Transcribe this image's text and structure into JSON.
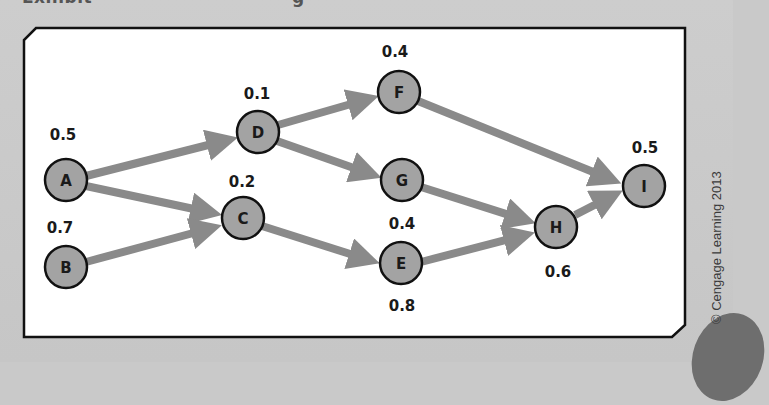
{
  "header": {
    "title_left": "Exhibit",
    "title_right": "g"
  },
  "diagram": {
    "colors": {
      "background": "#c9c9c9",
      "panel": "#ffffff",
      "frame": "#111111",
      "node_fill": "#a3a3a3",
      "node_stroke": "#111111",
      "arrow": "#8a8a8a"
    },
    "nodes": [
      {
        "id": "A",
        "label": "A",
        "value": "0.5"
      },
      {
        "id": "B",
        "label": "B",
        "value": "0.7"
      },
      {
        "id": "C",
        "label": "C",
        "value": "0.2"
      },
      {
        "id": "D",
        "label": "D",
        "value": "0.1"
      },
      {
        "id": "E",
        "label": "E",
        "value": "0.8"
      },
      {
        "id": "F",
        "label": "F",
        "value": "0.4"
      },
      {
        "id": "G",
        "label": "G",
        "value": "0.4"
      },
      {
        "id": "H",
        "label": "H",
        "value": "0.6"
      },
      {
        "id": "I",
        "label": "I",
        "value": "0.5"
      }
    ],
    "edges": [
      {
        "from": "A",
        "to": "D"
      },
      {
        "from": "A",
        "to": "C"
      },
      {
        "from": "B",
        "to": "C"
      },
      {
        "from": "D",
        "to": "F"
      },
      {
        "from": "D",
        "to": "G"
      },
      {
        "from": "C",
        "to": "E"
      },
      {
        "from": "F",
        "to": "I"
      },
      {
        "from": "G",
        "to": "H"
      },
      {
        "from": "E",
        "to": "H"
      },
      {
        "from": "H",
        "to": "I"
      }
    ]
  },
  "copyright": "© Cengage Learning 2013"
}
